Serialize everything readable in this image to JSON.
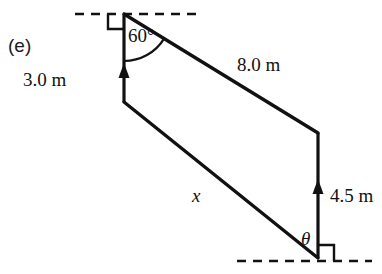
{
  "figure": {
    "part_label": "(e)",
    "caption_text": "(e)",
    "stroke_color": "#111111",
    "background_color": "#ffffff",
    "labels": {
      "side_3m": "3.0 m",
      "side_8m": "8.0 m",
      "side_45m": "4.5 m",
      "side_x": "x",
      "angle_60": "60°",
      "angle_theta": "θ"
    },
    "geometry": {
      "top_dashed_line": {
        "x1": 75,
        "y1": 14,
        "x2": 201,
        "y2": 14
      },
      "bottom_dashed_line": {
        "x1": 237,
        "y1": 261,
        "x2": 372,
        "y2": 261
      },
      "apex_point": {
        "x": 124,
        "y": 14
      },
      "left_lower_point": {
        "x": 124,
        "y": 102
      },
      "right_upper_point": {
        "x": 318,
        "y": 133
      },
      "right_lower_point": {
        "x": 318,
        "y": 258
      },
      "segment_8m": {
        "x1": 124,
        "y1": 14,
        "x2": 318,
        "y2": 133
      },
      "segment_vertical_3m": {
        "x1": 124,
        "y1": 14,
        "x2": 124,
        "y2": 102
      },
      "segment_vertical_45m": {
        "x1": 318,
        "y1": 133,
        "x2": 318,
        "y2": 258
      },
      "segment_x": {
        "x1": 124,
        "y1": 102,
        "x2": 318,
        "y2": 258
      },
      "right_angle_top": {
        "x": 124,
        "y": 14,
        "size": 15
      },
      "right_angle_bottom": {
        "x": 318,
        "y": 261,
        "size": 15
      },
      "arc_60_radius": 47,
      "arrow_3m_head_y": 67,
      "arrow_45m_head_y": 183
    },
    "icon_names": {
      "right_angle_marker": "right-angle-marker-icon",
      "arc_marker": "angle-arc-icon",
      "arrow_head": "arrow-head-icon",
      "dashed_reference": "dashed-reference-line-icon"
    }
  }
}
